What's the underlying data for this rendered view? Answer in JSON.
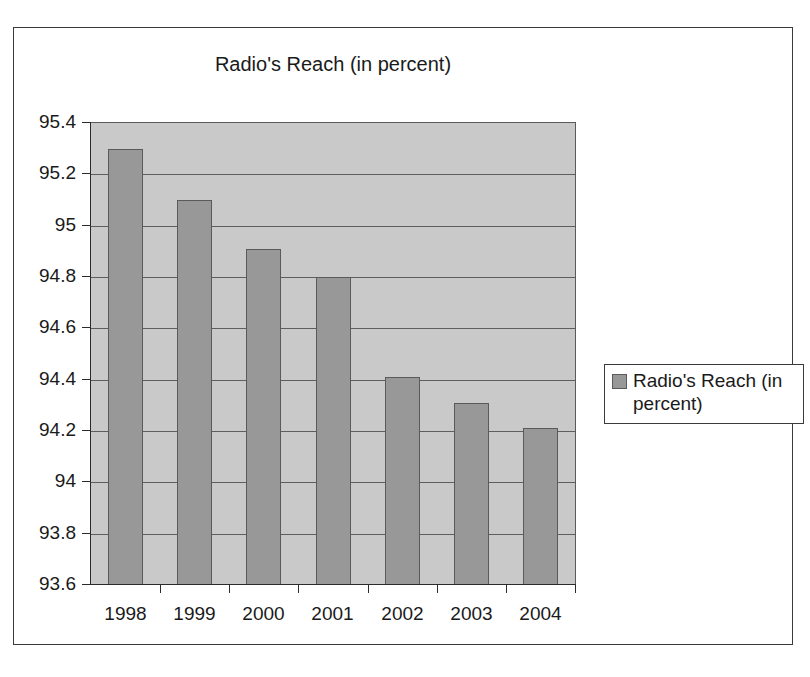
{
  "chart_data": {
    "type": "bar",
    "title": "Radio's Reach (in percent)",
    "xlabel": "",
    "ylabel": "",
    "categories": [
      "1998",
      "1999",
      "2000",
      "2001",
      "2002",
      "2003",
      "2004"
    ],
    "values": [
      95.3,
      95.1,
      94.91,
      94.8,
      94.41,
      94.31,
      94.21
    ],
    "series": [
      {
        "name": "Radio's Reach (in percent)",
        "values": [
          95.3,
          95.1,
          94.91,
          94.8,
          94.41,
          94.31,
          94.21
        ],
        "color": "#989898"
      }
    ],
    "ylim": [
      93.6,
      95.4
    ],
    "y_ticks": [
      95.4,
      95.2,
      95,
      94.8,
      94.6,
      94.4,
      94.2,
      94,
      93.8,
      93.6
    ],
    "y_tick_labels": [
      "95.4",
      "95.2",
      "95",
      "94.8",
      "94.6",
      "94.4",
      "94.2",
      "94",
      "93.8",
      "93.6"
    ],
    "grid": true,
    "grid_axis": "y",
    "legend": {
      "position": "right",
      "entries": [
        "Radio's Reach (in percent)"
      ]
    },
    "plot_background": "#c9c9c9",
    "bar_color": "#989898",
    "bar_border_color": "#5a5a5a"
  },
  "legend": {
    "label": "Radio's Reach (in percent)",
    "swatch_name": "legend-color-swatch"
  }
}
